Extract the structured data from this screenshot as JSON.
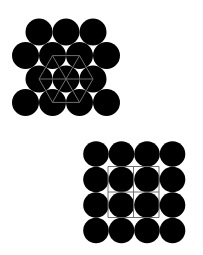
{
  "diagram": {
    "background": "#ffffff",
    "circle_color": "#000000",
    "lattice_color": "#6e6e6e",
    "hexagonal_packing": {
      "radius": 13.5,
      "rows": [
        {
          "y": 32,
          "x": [
            39,
            66,
            93
          ]
        },
        {
          "y": 55.5,
          "x": [
            25.5,
            52.5,
            79.5,
            106.5
          ]
        },
        {
          "y": 79,
          "x": [
            39,
            66,
            93
          ]
        },
        {
          "y": 102.5,
          "x": [
            25.5,
            52.5,
            79.5,
            106.5
          ]
        }
      ],
      "hexagon": {
        "center": [
          66,
          79
        ],
        "vertices": [
          [
            39,
            79
          ],
          [
            52.5,
            55.6
          ],
          [
            79.5,
            55.6
          ],
          [
            93,
            79
          ],
          [
            79.5,
            102.4
          ],
          [
            52.5,
            102.4
          ]
        ],
        "spokes": [
          [
            [
              39,
              79
            ],
            [
              93,
              79
            ]
          ],
          [
            [
              52.5,
              55.6
            ],
            [
              79.5,
              102.4
            ]
          ],
          [
            [
              79.5,
              55.6
            ],
            [
              52.5,
              102.4
            ]
          ]
        ]
      }
    },
    "square_packing": {
      "radius": 12.8,
      "rows": [
        {
          "y": 154,
          "x": [
            96,
            121.5,
            147,
            172.5
          ]
        },
        {
          "y": 179.5,
          "x": [
            96,
            121.5,
            147,
            172.5
          ]
        },
        {
          "y": 205,
          "x": [
            96,
            121.5,
            147,
            172.5
          ]
        },
        {
          "y": 230.5,
          "x": [
            96,
            121.5,
            147,
            172.5
          ]
        }
      ],
      "grid": {
        "x_lines": [
          108,
          133.5,
          159
        ],
        "y_lines": [
          166.5,
          192,
          217.5
        ]
      }
    }
  }
}
